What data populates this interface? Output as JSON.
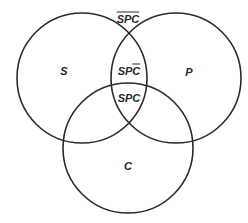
{
  "diagram": {
    "type": "venn",
    "stroke_color": "#2b2b2b",
    "background": "#ffffff",
    "circles": [
      {
        "id": "S",
        "label": "S",
        "cx": 82,
        "cy": 78,
        "r": 65
      },
      {
        "id": "P",
        "label": "P",
        "cx": 176,
        "cy": 78,
        "r": 65
      },
      {
        "id": "C",
        "label": "C",
        "cx": 128,
        "cy": 148,
        "r": 65
      }
    ],
    "labels": {
      "s": "S",
      "p": "P",
      "c": "C",
      "outside": {
        "parts": [
          {
            "t": "S",
            "bar": true
          },
          {
            "t": "P",
            "bar": true
          },
          {
            "t": "C",
            "bar": true
          }
        ],
        "text": "S̄P̄C̄"
      },
      "sp_not_c": {
        "parts": [
          {
            "t": "S",
            "bar": false
          },
          {
            "t": "P",
            "bar": false
          },
          {
            "t": "C",
            "bar": true
          }
        ],
        "text": "SPC̄"
      },
      "spc": {
        "parts": [
          {
            "t": "S",
            "bar": false
          },
          {
            "t": "P",
            "bar": false
          },
          {
            "t": "C",
            "bar": false
          }
        ],
        "text": "SPC"
      }
    }
  }
}
